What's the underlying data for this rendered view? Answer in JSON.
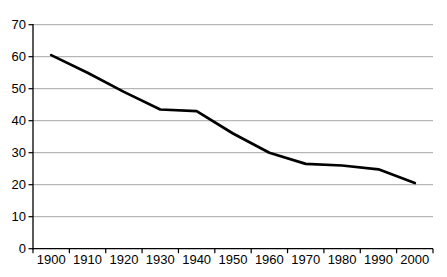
{
  "chart_data": {
    "type": "line",
    "title": "",
    "xlabel": "",
    "ylabel": "",
    "categories": [
      "1900",
      "1910",
      "1920",
      "1930",
      "1940",
      "1950",
      "1960",
      "1970",
      "1980",
      "1990",
      "2000"
    ],
    "series": [
      {
        "name": "series-1",
        "values": [
          60.5,
          55,
          49,
          43.5,
          43,
          36,
          30,
          26.5,
          26,
          24.8,
          20.5
        ]
      }
    ],
    "ylim": [
      0,
      70
    ],
    "y_ticks": [
      0,
      10,
      20,
      30,
      40,
      50,
      60,
      70
    ],
    "grid": true,
    "legend_position": "none",
    "colors": {
      "line": "#000000",
      "gridline": "#a6a6a6",
      "axis": "#000000",
      "tick_label": "#000000",
      "background": "#ffffff"
    }
  }
}
